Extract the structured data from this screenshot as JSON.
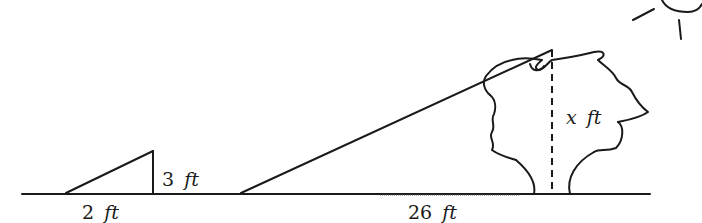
{
  "diagram": {
    "small_triangle": {
      "height_label": {
        "value": "3",
        "unit": "ft"
      },
      "base_label": {
        "value": "2",
        "unit": "ft"
      }
    },
    "large_triangle": {
      "height_label": {
        "value": "x",
        "unit": "ft"
      },
      "base_label": {
        "value": "26",
        "unit": "ft"
      }
    },
    "objects": [
      "ground-line",
      "small-triangle",
      "large-triangle",
      "tree",
      "sun"
    ],
    "colors": {
      "ink": "#1a1a1a",
      "background": "#ffffff"
    }
  }
}
